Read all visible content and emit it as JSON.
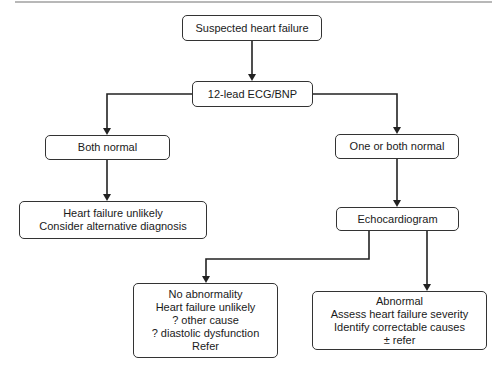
{
  "diagram": {
    "type": "flowchart",
    "line_color": "#222222",
    "nodes": {
      "start": {
        "lines": [
          "Suspected heart failure"
        ]
      },
      "test": {
        "lines": [
          "12-lead ECG/BNP"
        ]
      },
      "both_normal": {
        "lines": [
          "Both normal"
        ]
      },
      "one_or_both": {
        "lines": [
          "One or both normal"
        ]
      },
      "unlikely": {
        "lines": [
          "Heart failure unlikely",
          "Consider alternative diagnosis"
        ]
      },
      "echo": {
        "lines": [
          "Echocardiogram"
        ]
      },
      "no_abnormality": {
        "lines": [
          "No abnormality",
          "Heart failure unlikely",
          "? other cause",
          "? diastolic dysfunction",
          "Refer"
        ]
      },
      "abnormal": {
        "lines": [
          "Abnormal",
          "Assess heart failure severity",
          "Identify correctable causes",
          "± refer"
        ]
      }
    },
    "edges": [
      {
        "from": "start",
        "to": "test"
      },
      {
        "from": "test",
        "to": "both_normal"
      },
      {
        "from": "test",
        "to": "one_or_both"
      },
      {
        "from": "both_normal",
        "to": "unlikely"
      },
      {
        "from": "one_or_both",
        "to": "echo"
      },
      {
        "from": "echo",
        "to": "no_abnormality"
      },
      {
        "from": "echo",
        "to": "abnormal"
      }
    ]
  }
}
